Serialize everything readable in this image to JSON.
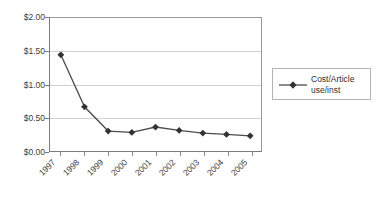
{
  "chart_data": {
    "type": "line",
    "title": "",
    "xlabel": "",
    "ylabel": "",
    "categories": [
      "1997",
      "1998",
      "1999",
      "2000",
      "2001",
      "2002",
      "2003",
      "2004",
      "2005"
    ],
    "series": [
      {
        "name": "Cost/Article use/inst",
        "values": [
          1.44,
          0.67,
          0.31,
          0.29,
          0.37,
          0.32,
          0.28,
          0.26,
          0.24
        ]
      }
    ],
    "ylim": [
      0,
      2
    ],
    "ytick_labels": [
      "$2.00",
      "$1.50",
      "$1.00",
      "$0.50",
      "$0.00"
    ],
    "ytick_values": [
      2.0,
      1.5,
      1.0,
      0.5,
      0.0
    ],
    "grid": true,
    "legend_position": "right",
    "marker": "diamond",
    "line_color": "#4d4d4d",
    "marker_color": "#333333",
    "grid_color": "#d2d2d2",
    "axis_color": "#7a7a7a"
  },
  "legend": {
    "entries": [
      {
        "line1": "Cost/Article",
        "line2": "use/inst"
      }
    ]
  }
}
